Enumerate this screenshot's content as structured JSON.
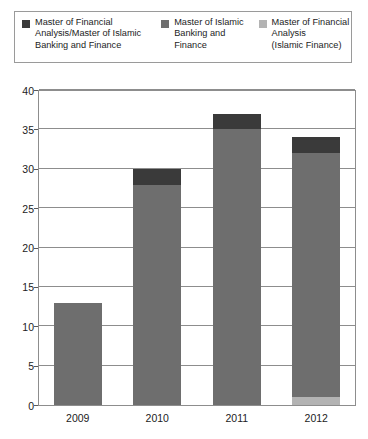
{
  "chart_data": {
    "type": "bar",
    "stacked": true,
    "title": "",
    "xlabel": "",
    "ylabel": "",
    "categories": [
      "2009",
      "2010",
      "2011",
      "2012"
    ],
    "ylim": [
      0,
      40
    ],
    "yticks": [
      0,
      5,
      10,
      15,
      20,
      25,
      30,
      35,
      40
    ],
    "ytick_labels": [
      "0",
      "5",
      "10",
      "15",
      "20",
      "25",
      "30",
      "35",
      "40"
    ],
    "grid": true,
    "legend_position": "top",
    "series": [
      {
        "name": "Master of Financial Analysis (Islamic Finance)",
        "color": "#b3b3b3",
        "values": [
          0,
          0,
          0,
          1
        ]
      },
      {
        "name": "Master of Islamic Banking and Finance",
        "color": "#6e6e6e",
        "values": [
          13,
          28,
          35,
          31
        ]
      },
      {
        "name": "Master of Financial Analysis/Master of Islamic Banking and Finance",
        "color": "#3a3a3a",
        "values": [
          0,
          2,
          2,
          2
        ]
      }
    ],
    "totals": [
      13,
      30,
      37,
      34
    ]
  },
  "legend": {
    "entries": [
      {
        "label": "Master of Financial\nAnalysis/Master of Islamic\nBanking and Finance",
        "color": "#3a3a3a",
        "swatch_name": "legend-swatch-dark"
      },
      {
        "label": "Master of Islamic\nBanking and\nFinance",
        "color": "#6e6e6e",
        "swatch_name": "legend-swatch-medium"
      },
      {
        "label": "Master of Financial\nAnalysis\n(Islamic Finance)",
        "color": "#b3b3b3",
        "swatch_name": "legend-swatch-light"
      }
    ]
  },
  "axis": {
    "y_labels": [
      "40",
      "35",
      "30",
      "25",
      "20",
      "15",
      "10",
      "5",
      "0"
    ],
    "x_labels": [
      "2009",
      "2010",
      "2011",
      "2012"
    ]
  }
}
